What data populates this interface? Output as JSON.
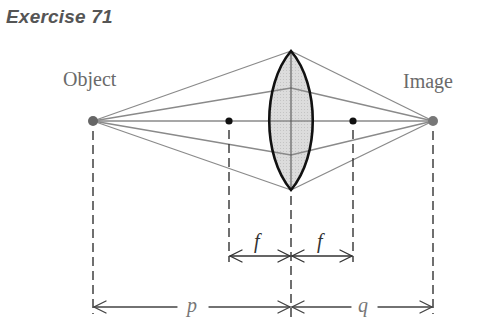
{
  "title": "Exercise 71",
  "labels": {
    "object": "Object",
    "image": "Image",
    "focal_left": "f",
    "focal_right": "f",
    "object_distance": "p",
    "image_distance": "q"
  },
  "colors": {
    "ray": "#8a8a8a",
    "lens_fill": "#d9d9d9",
    "lens_outline": "#111111",
    "object_point": "#666666",
    "focal_point": "#111111",
    "dimension_line": "#333333",
    "label_gray": "#6a6a6a"
  },
  "geometry": {
    "axis_y": 121,
    "object_x": 93,
    "image_x": 433,
    "lens_x": 291,
    "lens_top_y": 51,
    "lens_bottom_y": 190,
    "lens_half_width": 23,
    "focal_left_x": 229,
    "focal_right_x": 353,
    "ray_lens_hits_y": [
      51,
      88,
      121,
      155,
      190
    ]
  }
}
